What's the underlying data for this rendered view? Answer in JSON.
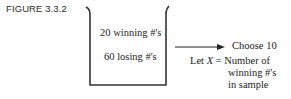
{
  "figure": {
    "label": "FIGURE 3.3.2"
  },
  "urn": {
    "line_color": "#333333",
    "contents": [
      {
        "label": "20 winning #'s"
      },
      {
        "label": "60 losing #'s"
      }
    ]
  },
  "action": {
    "label": "Choose 10"
  },
  "definition": {
    "prefix": "Let ",
    "variable": "X",
    "equals": " = Number of",
    "line2": "winning #'s",
    "line3": "in sample"
  }
}
